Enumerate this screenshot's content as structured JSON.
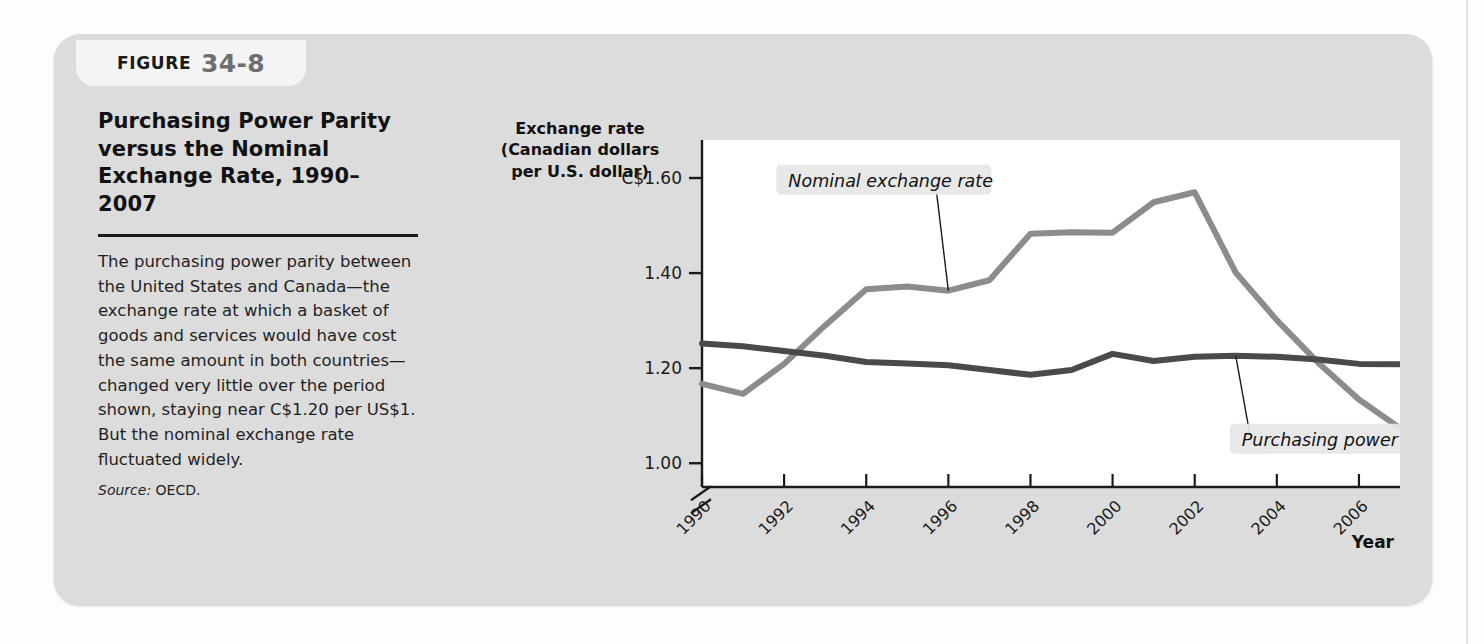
{
  "figure": {
    "label_word": "FIGURE",
    "number": "34-8"
  },
  "caption": {
    "title": "Purchasing Power Parity versus the Nominal Exchange Rate, 1990–2007",
    "body": "The purchasing power parity between the United States and Canada—the exchange rate at which a basket of goods and services would have cost the same amount in both countries—changed very little over the period shown, staying near C$1.20 per US$1. But the nominal exchange rate fluctuated widely.",
    "source_word": "Source:",
    "source_value": "OECD."
  },
  "chart_data": {
    "type": "line",
    "title": "",
    "ylabel": "Exchange rate (Canadian dollars per U.S. dollar)",
    "ylabel_lines": [
      "Exchange rate",
      "(Canadian dollars",
      "per U.S. dollar)"
    ],
    "xlabel": "Year",
    "x": [
      1990,
      1991,
      1992,
      1993,
      1994,
      1995,
      1996,
      1997,
      1998,
      1999,
      2000,
      2001,
      2002,
      2003,
      2004,
      2005,
      2006,
      2007
    ],
    "xtick_labels": [
      "1990",
      "1992",
      "1994",
      "1996",
      "1998",
      "2000",
      "2002",
      "2004",
      "2006"
    ],
    "xticks": [
      1990,
      1992,
      1994,
      1996,
      1998,
      2000,
      2002,
      2004,
      2006
    ],
    "ytick_labels": [
      "C$1.60",
      "1.40",
      "1.20",
      "1.00"
    ],
    "yticks": [
      1.6,
      1.4,
      1.2,
      1.0
    ],
    "ylim": [
      0.95,
      1.68
    ],
    "xlim": [
      1990,
      2007
    ],
    "axis_break": true,
    "grid": false,
    "legend": "annotations",
    "series": [
      {
        "name": "Nominal exchange rate",
        "color": "#8c8c8c",
        "values": [
          1.167,
          1.146,
          1.209,
          1.29,
          1.366,
          1.372,
          1.363,
          1.385,
          1.483,
          1.486,
          1.485,
          1.549,
          1.57,
          1.401,
          1.301,
          1.212,
          1.134,
          1.074
        ]
      },
      {
        "name": "Purchasing power parity",
        "color": "#4a4a4a",
        "values": [
          1.252,
          1.246,
          1.236,
          1.226,
          1.213,
          1.21,
          1.206,
          1.196,
          1.186,
          1.196,
          1.23,
          1.215,
          1.224,
          1.226,
          1.224,
          1.218,
          1.209,
          1.208
        ]
      }
    ],
    "annotations": [
      {
        "text": "Nominal exchange rate",
        "target_year": 1996,
        "target_value": 1.363
      },
      {
        "text": "Purchasing power parity",
        "target_year": 2003,
        "target_value": 1.226
      }
    ]
  }
}
